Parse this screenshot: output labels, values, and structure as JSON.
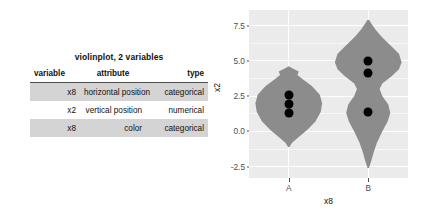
{
  "table": {
    "title": "violinplot, 2 variables",
    "columns": [
      "variable",
      "attribute",
      "type"
    ],
    "rows": [
      {
        "variable": "x8",
        "attribute": "horizontal position",
        "type": "categorical"
      },
      {
        "variable": "x2",
        "attribute": "vertical position",
        "type": "numerical"
      },
      {
        "variable": "x8",
        "attribute": "color",
        "type": "categorical"
      }
    ]
  },
  "chart_data": {
    "type": "violin",
    "title": "",
    "xlabel": "x8",
    "ylabel": "x2",
    "categories": [
      "A",
      "B"
    ],
    "ylim": [
      -3.3,
      8.6
    ],
    "yticks": [
      7.5,
      5.0,
      2.5,
      0.0,
      -2.5
    ],
    "ytick_labels": [
      "7.5",
      "5.0",
      "2.5",
      "0.0",
      "-2.5"
    ],
    "grid": true,
    "legend": "none",
    "panel_color": "#ebebeb",
    "violin_color": "#8c8c8c",
    "point_color": "#000000",
    "series": [
      {
        "name": "A",
        "points": [
          2.6,
          1.95,
          1.3
        ],
        "density": [
          {
            "y": -1.1,
            "w": 0.02
          },
          {
            "y": -0.8,
            "w": 0.1
          },
          {
            "y": -0.4,
            "w": 0.3
          },
          {
            "y": 0.1,
            "w": 0.55
          },
          {
            "y": 0.7,
            "w": 0.8
          },
          {
            "y": 1.4,
            "w": 0.96
          },
          {
            "y": 2.0,
            "w": 1.0
          },
          {
            "y": 2.6,
            "w": 0.93
          },
          {
            "y": 3.2,
            "w": 0.7
          },
          {
            "y": 3.7,
            "w": 0.42
          },
          {
            "y": 4.0,
            "w": 0.26
          },
          {
            "y": 4.25,
            "w": 0.3
          },
          {
            "y": 4.45,
            "w": 0.12
          },
          {
            "y": 4.6,
            "w": 0.02
          }
        ]
      },
      {
        "name": "B",
        "points": [
          5.0,
          4.15,
          1.35
        ],
        "density": [
          {
            "y": -2.6,
            "w": 0.02
          },
          {
            "y": -2.1,
            "w": 0.09
          },
          {
            "y": -1.5,
            "w": 0.16
          },
          {
            "y": -0.8,
            "w": 0.26
          },
          {
            "y": 0.0,
            "w": 0.42
          },
          {
            "y": 0.7,
            "w": 0.58
          },
          {
            "y": 1.3,
            "w": 0.66
          },
          {
            "y": 1.9,
            "w": 0.6
          },
          {
            "y": 2.5,
            "w": 0.42
          },
          {
            "y": 3.0,
            "w": 0.34
          },
          {
            "y": 3.4,
            "w": 0.42
          },
          {
            "y": 3.9,
            "w": 0.7
          },
          {
            "y": 4.4,
            "w": 0.92
          },
          {
            "y": 4.9,
            "w": 1.0
          },
          {
            "y": 5.5,
            "w": 0.92
          },
          {
            "y": 6.1,
            "w": 0.66
          },
          {
            "y": 6.7,
            "w": 0.4
          },
          {
            "y": 7.2,
            "w": 0.22
          },
          {
            "y": 7.6,
            "w": 0.1
          },
          {
            "y": 7.9,
            "w": 0.03
          }
        ]
      }
    ]
  }
}
